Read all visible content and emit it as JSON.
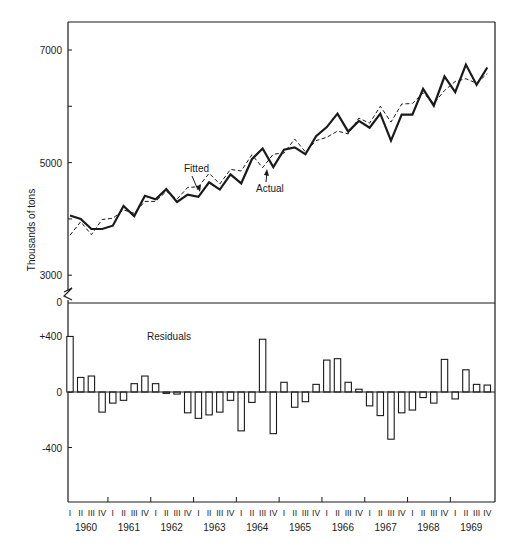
{
  "chart_data": [
    {
      "type": "line",
      "title": "",
      "xlabel": "",
      "ylabel": "Thousands of tons",
      "ylim": [
        2500,
        7500
      ],
      "yticks": [
        3000,
        5000,
        7000
      ],
      "yminor_ticks": [
        4000,
        6000
      ],
      "grid": false,
      "annotations": [
        "Fitted",
        "Actual"
      ],
      "x": [
        "1960-I",
        "1960-II",
        "1960-III",
        "1960-IV",
        "1961-I",
        "1961-II",
        "1961-III",
        "1961-IV",
        "1962-I",
        "1962-II",
        "1962-III",
        "1962-IV",
        "1963-I",
        "1963-II",
        "1963-III",
        "1963-IV",
        "1964-I",
        "1964-II",
        "1964-III",
        "1964-IV",
        "1965-I",
        "1965-II",
        "1965-III",
        "1965-IV",
        "1966-I",
        "1966-II",
        "1966-III",
        "1966-IV",
        "1967-I",
        "1967-II",
        "1967-III",
        "1967-IV",
        "1968-I",
        "1968-II",
        "1968-III",
        "1968-IV",
        "1969-I",
        "1969-II",
        "1969-III",
        "1969-IV"
      ],
      "series": [
        {
          "name": "Actual",
          "style": "solid-thick",
          "values": [
            4060,
            4000,
            3820,
            3820,
            3880,
            4230,
            4050,
            4410,
            4350,
            4530,
            4300,
            4430,
            4390,
            4650,
            4520,
            4790,
            4630,
            5060,
            5250,
            4920,
            5230,
            5270,
            5150,
            5470,
            5630,
            5870,
            5550,
            5740,
            5620,
            5870,
            5390,
            5850,
            5850,
            6310,
            6010,
            6530,
            6250,
            6740,
            6380,
            6690
          ]
        },
        {
          "name": "Fitted",
          "style": "dashed",
          "values": [
            3710,
            3950,
            3720,
            3990,
            4010,
            4160,
            4100,
            4310,
            4310,
            4490,
            4350,
            4560,
            4570,
            4810,
            4620,
            4880,
            4850,
            5140,
            4910,
            5150,
            5170,
            5420,
            5190,
            5390,
            5450,
            5560,
            5510,
            5790,
            5700,
            6000,
            5720,
            6040,
            6050,
            6240,
            6050,
            6280,
            6440,
            6490,
            6410,
            6580
          ]
        }
      ]
    },
    {
      "type": "bar",
      "title": "Residuals",
      "xlabel": "",
      "ylabel": "",
      "ylim": [
        -1000,
        800
      ],
      "yticks": [
        "+400",
        "0",
        "-400"
      ],
      "grid": false,
      "categories": [
        "1960-I",
        "1960-II",
        "1960-III",
        "1960-IV",
        "1961-I",
        "1961-II",
        "1961-III",
        "1961-IV",
        "1962-I",
        "1962-II",
        "1962-III",
        "1962-IV",
        "1963-I",
        "1963-II",
        "1963-III",
        "1963-IV",
        "1964-I",
        "1964-II",
        "1964-III",
        "1964-IV",
        "1965-I",
        "1965-II",
        "1965-III",
        "1965-IV",
        "1966-I",
        "1966-II",
        "1966-III",
        "1966-IV",
        "1967-I",
        "1967-II",
        "1967-III",
        "1967-IV",
        "1968-I",
        "1968-II",
        "1968-III",
        "1968-IV",
        "1969-I",
        "1969-II",
        "1969-III",
        "1969-IV"
      ],
      "values": [
        400,
        105,
        115,
        -145,
        -80,
        -60,
        60,
        115,
        60,
        -10,
        -15,
        -150,
        -190,
        -165,
        -145,
        -60,
        -280,
        -75,
        380,
        -300,
        70,
        -110,
        -70,
        55,
        230,
        240,
        70,
        20,
        -100,
        -170,
        -340,
        -150,
        -130,
        -40,
        -80,
        235,
        -50,
        160,
        55,
        50
      ]
    }
  ],
  "axis": {
    "ylabel": "Thousands of tons",
    "top_ticks": [
      {
        "v": 7000,
        "label": "7000"
      },
      {
        "v": 5000,
        "label": "5000"
      },
      {
        "v": 3000,
        "label": "3000"
      }
    ],
    "break_label": "0",
    "bottom_ticks": [
      {
        "v": 400,
        "label": "+400"
      },
      {
        "v": 0,
        "label": "0"
      },
      {
        "v": -400,
        "label": "-400"
      }
    ],
    "quarters": [
      "I",
      "II",
      "III",
      "IV"
    ],
    "years": [
      "1960",
      "1961",
      "1962",
      "1963",
      "1964",
      "1965",
      "1966",
      "1967",
      "1968",
      "1969"
    ]
  },
  "labels": {
    "fitted": "Fitted",
    "actual": "Actual",
    "residuals": "Residuals"
  },
  "colors": {
    "ink": "#1a1a1a",
    "background": "#ffffff"
  }
}
